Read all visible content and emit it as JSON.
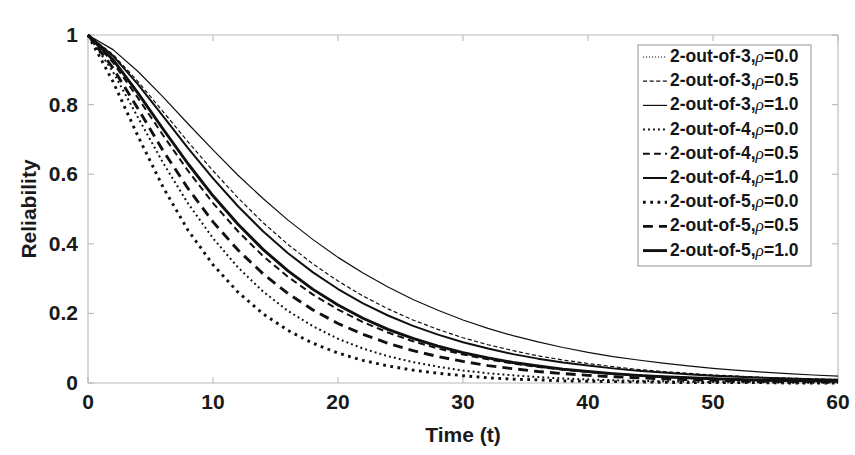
{
  "chart_data": {
    "type": "line",
    "title": "",
    "xlabel": "Time (t)",
    "ylabel": "Reliability",
    "xlim": [
      0,
      60
    ],
    "ylim": [
      0,
      1
    ],
    "grid": false,
    "legend_position": "top-right",
    "x_ticks": [
      "0",
      "10",
      "20",
      "30",
      "40",
      "50",
      "60"
    ],
    "x_tick_values": [
      0,
      10,
      20,
      30,
      40,
      50,
      60
    ],
    "y_ticks": [
      "0",
      "0.2",
      "0.4",
      "0.6",
      "0.8",
      "1"
    ],
    "y_tick_values": [
      0,
      0.2,
      0.4,
      0.6,
      0.8,
      1
    ],
    "x": [
      0,
      2,
      4,
      6,
      8,
      10,
      12,
      14,
      16,
      18,
      20,
      22,
      24,
      26,
      28,
      30,
      32,
      34,
      36,
      38,
      40,
      42,
      44,
      46,
      48,
      50,
      52,
      54,
      56,
      58,
      60
    ],
    "series": [
      {
        "name": "2-out-of-3, ρ=0.0",
        "k": 2,
        "n": 3,
        "rho": 0.0,
        "style": "dotted",
        "width": 1.2,
        "values": [
          1.0,
          0.927,
          0.832,
          0.731,
          0.632,
          0.54,
          0.458,
          0.386,
          0.323,
          0.269,
          0.223,
          0.185,
          0.152,
          0.126,
          0.103,
          0.085,
          0.069,
          0.057,
          0.046,
          0.038,
          0.031,
          0.025,
          0.02,
          0.017,
          0.013,
          0.011,
          0.009,
          0.007,
          0.006,
          0.005,
          0.004
        ]
      },
      {
        "name": "2-out-of-3, ρ=0.5",
        "k": 2,
        "n": 3,
        "rho": 0.5,
        "style": "dashed",
        "width": 1.2,
        "values": [
          1.0,
          0.944,
          0.866,
          0.78,
          0.693,
          0.61,
          0.532,
          0.461,
          0.398,
          0.342,
          0.293,
          0.25,
          0.213,
          0.181,
          0.154,
          0.13,
          0.11,
          0.093,
          0.078,
          0.066,
          0.056,
          0.047,
          0.039,
          0.033,
          0.028,
          0.023,
          0.02,
          0.016,
          0.014,
          0.012,
          0.01
        ]
      },
      {
        "name": "2-out-of-3, ρ=1.0",
        "k": 2,
        "n": 3,
        "rho": 1.0,
        "style": "solid",
        "width": 1.2,
        "values": [
          1.0,
          0.958,
          0.895,
          0.822,
          0.745,
          0.67,
          0.597,
          0.53,
          0.468,
          0.412,
          0.361,
          0.316,
          0.276,
          0.24,
          0.209,
          0.181,
          0.157,
          0.136,
          0.118,
          0.102,
          0.088,
          0.076,
          0.066,
          0.057,
          0.049,
          0.042,
          0.036,
          0.031,
          0.027,
          0.023,
          0.02
        ]
      },
      {
        "name": "2-out-of-4, ρ=0.0",
        "k": 2,
        "n": 4,
        "rho": 0.0,
        "style": "dotted",
        "width": 2.0,
        "values": [
          1.0,
          0.894,
          0.763,
          0.633,
          0.516,
          0.416,
          0.332,
          0.263,
          0.207,
          0.163,
          0.127,
          0.099,
          0.077,
          0.06,
          0.047,
          0.036,
          0.028,
          0.022,
          0.017,
          0.013,
          0.01,
          0.008,
          0.006,
          0.005,
          0.004,
          0.003,
          0.002,
          0.002,
          0.001,
          0.001,
          0.001
        ]
      },
      {
        "name": "2-out-of-4, ρ=0.5",
        "k": 2,
        "n": 4,
        "rho": 0.5,
        "style": "dashed",
        "width": 2.0,
        "values": [
          1.0,
          0.921,
          0.819,
          0.712,
          0.61,
          0.517,
          0.436,
          0.365,
          0.305,
          0.254,
          0.211,
          0.175,
          0.145,
          0.12,
          0.099,
          0.082,
          0.068,
          0.056,
          0.046,
          0.038,
          0.032,
          0.026,
          0.022,
          0.018,
          0.015,
          0.012,
          0.01,
          0.008,
          0.007,
          0.006,
          0.005
        ]
      },
      {
        "name": "2-out-of-4, ρ=1.0",
        "k": 2,
        "n": 4,
        "rho": 1.0,
        "style": "solid",
        "width": 2.0,
        "values": [
          1.0,
          0.94,
          0.858,
          0.767,
          0.675,
          0.588,
          0.508,
          0.436,
          0.373,
          0.318,
          0.27,
          0.229,
          0.194,
          0.164,
          0.139,
          0.117,
          0.099,
          0.083,
          0.07,
          0.059,
          0.05,
          0.042,
          0.035,
          0.03,
          0.025,
          0.021,
          0.018,
          0.015,
          0.013,
          0.011,
          0.009
        ]
      },
      {
        "name": "2-out-of-5, ρ=0.0",
        "k": 2,
        "n": 5,
        "rho": 0.0,
        "style": "dotted",
        "width": 2.9,
        "values": [
          1.0,
          0.866,
          0.709,
          0.563,
          0.439,
          0.34,
          0.261,
          0.199,
          0.151,
          0.114,
          0.086,
          0.065,
          0.049,
          0.037,
          0.028,
          0.021,
          0.015,
          0.011,
          0.009,
          0.006,
          0.005,
          0.004,
          0.003,
          0.002,
          0.001,
          0.001,
          0.001,
          0.001,
          0.0,
          0.0,
          0.0
        ]
      },
      {
        "name": "2-out-of-5, ρ=0.5",
        "k": 2,
        "n": 5,
        "rho": 0.5,
        "style": "dashed",
        "width": 2.9,
        "values": [
          1.0,
          0.905,
          0.788,
          0.668,
          0.559,
          0.463,
          0.382,
          0.314,
          0.257,
          0.21,
          0.171,
          0.14,
          0.114,
          0.093,
          0.076,
          0.062,
          0.05,
          0.041,
          0.033,
          0.027,
          0.022,
          0.018,
          0.015,
          0.012,
          0.01,
          0.008,
          0.006,
          0.005,
          0.004,
          0.004,
          0.003
        ]
      },
      {
        "name": "2-out-of-5, ρ=1.0",
        "k": 2,
        "n": 5,
        "rho": 1.0,
        "style": "solid",
        "width": 2.9,
        "values": [
          1.0,
          0.929,
          0.833,
          0.73,
          0.63,
          0.538,
          0.456,
          0.384,
          0.322,
          0.269,
          0.224,
          0.186,
          0.154,
          0.128,
          0.106,
          0.087,
          0.072,
          0.059,
          0.049,
          0.04,
          0.033,
          0.027,
          0.022,
          0.018,
          0.015,
          0.012,
          0.01,
          0.008,
          0.007,
          0.006,
          0.005
        ]
      }
    ]
  },
  "legend": {
    "entries": [
      {
        "label": "2-out-of-3,",
        "rho": "ρ",
        "value": "=0.0"
      },
      {
        "label": "2-out-of-3,",
        "rho": "ρ",
        "value": "=0.5"
      },
      {
        "label": "2-out-of-3,",
        "rho": "ρ",
        "value": "=1.0"
      },
      {
        "label": "2-out-of-4,",
        "rho": "ρ",
        "value": "=0.0"
      },
      {
        "label": "2-out-of-4,",
        "rho": "ρ",
        "value": "=0.5"
      },
      {
        "label": "2-out-of-4,",
        "rho": "ρ",
        "value": "=1.0"
      },
      {
        "label": "2-out-of-5,",
        "rho": "ρ",
        "value": "=0.0"
      },
      {
        "label": "2-out-of-5,",
        "rho": "ρ",
        "value": "=0.5"
      },
      {
        "label": "2-out-of-5,",
        "rho": "ρ",
        "value": "=1.0"
      }
    ]
  },
  "colors": {
    "curve": "#101010",
    "axis": "#b9b9b9",
    "text": "#1a1a1a",
    "legend_border": "#9d9d9d",
    "background": "#ffffff"
  }
}
